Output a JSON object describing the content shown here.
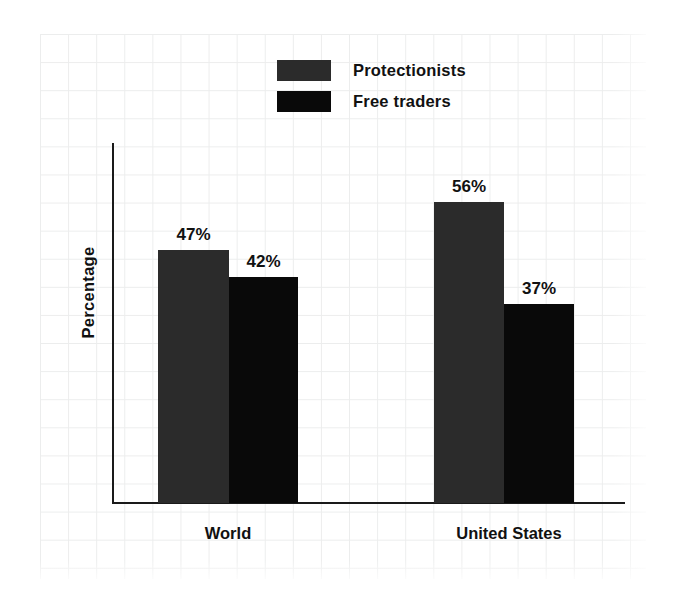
{
  "chart_data": {
    "type": "bar",
    "title": "",
    "subtitle": "",
    "xlabel": "",
    "ylabel": "Percentage",
    "categories": [
      "World",
      "United States"
    ],
    "series": [
      {
        "name": "Protectionists",
        "color": "#2b2b2b",
        "values": [
          47,
          42
        ],
        "value_labels": [
          "47%",
          "42%"
        ]
      },
      {
        "name": "Free traders",
        "color": "#090909",
        "values": [
          56,
          37
        ],
        "value_labels": [
          "56%",
          "37%"
        ]
      }
    ],
    "bars": [
      {
        "group": "World",
        "series": "Protectionists",
        "value": 47,
        "label": "47%"
      },
      {
        "group": "World",
        "series": "Free traders",
        "value": 42,
        "label": "42%"
      },
      {
        "group": "United States",
        "series": "Protectionists",
        "value": 56,
        "label": "56%"
      },
      {
        "group": "United States",
        "series": "Free traders",
        "value": 37,
        "label": "37%"
      }
    ],
    "ylim": [
      0,
      67
    ],
    "y_tick_labels": [],
    "grid": true,
    "grid_style": "graph-paper",
    "legend_position": "top-center",
    "axis_color": "#1a1a1a",
    "grid_color": "#eceded",
    "background_color": "#ffffff"
  },
  "legend": {
    "items": [
      {
        "label": "Protectionists",
        "swatch": "protectionists-swatch"
      },
      {
        "label": "Free traders",
        "swatch": "free-traders-swatch"
      }
    ]
  },
  "axes": {
    "y_title": "Percentage",
    "category_labels": [
      "World",
      "United States"
    ]
  },
  "values": {
    "world_protectionists": "47%",
    "world_free_traders": "42%",
    "us_protectionists": "56%",
    "us_free_traders": "37%"
  }
}
